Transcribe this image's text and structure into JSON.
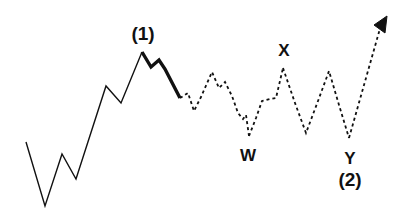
{
  "diagram": {
    "type": "elliott-wave-schematic",
    "background_color": "#ffffff",
    "line_color": "#111111",
    "impulse_line_width": 1.4,
    "bold_line_width": 3.4,
    "corrective_line_width": 1.8,
    "corrective_dash_pattern": "3,3",
    "labels": [
      {
        "id": "wave-one",
        "text": "(1)",
        "x": 143,
        "y": 40,
        "style": "label-paren"
      },
      {
        "id": "wave-w",
        "text": "W",
        "x": 248,
        "y": 161,
        "style": "label-letter"
      },
      {
        "id": "wave-x",
        "text": "X",
        "x": 284,
        "y": 56,
        "style": "label-letter"
      },
      {
        "id": "wave-y",
        "text": "Y",
        "x": 350,
        "y": 164,
        "style": "label-letter"
      },
      {
        "id": "wave-two",
        "text": "(2)",
        "x": 350,
        "y": 186,
        "style": "label-paren"
      }
    ],
    "paths": {
      "impulse_rise": "M 26,142 L 45,206 L 62,154 L 76,179 L 106,86 L 121,103 L 142,52",
      "bold_correction": "M 142,52 L 151,67 L 159,60 L 165,69 L 180,98",
      "corrective_w": "M 180,98 L 188,93 L 194,111 L 201,97 L 212,72 L 219,88 L 225,82 L 232,96 L 238,113 L 243,119 L 246,115 L 249,136",
      "corrective_x": "M 249,136 L 256,118 L 262,101 L 270,99 L 276,98 L 283,68",
      "corrective_y": "M 283,68 L 295,103 L 306,133 L 318,101 L 329,71 L 339,105 L 349,138",
      "projection_arrow_shaft": "M 349,138 L 381,25",
      "projection_arrow_head": "M 387,16 L 374,25 L 385,33 Z"
    },
    "points": {
      "start": [
        26,
        142
      ],
      "low_1": [
        45,
        206
      ],
      "peak_a": [
        62,
        154
      ],
      "low_2": [
        76,
        179
      ],
      "peak_b": [
        106,
        86
      ],
      "dip_b": [
        121,
        103
      ],
      "wave_1_peak": [
        142,
        52
      ],
      "bold_end": [
        180,
        98
      ],
      "w_low": [
        249,
        136
      ],
      "x_peak": [
        283,
        68
      ],
      "mid_low": [
        306,
        133
      ],
      "mid_peak": [
        329,
        71
      ],
      "y_low": [
        349,
        138
      ],
      "arrow_tip": [
        387,
        16
      ]
    }
  }
}
